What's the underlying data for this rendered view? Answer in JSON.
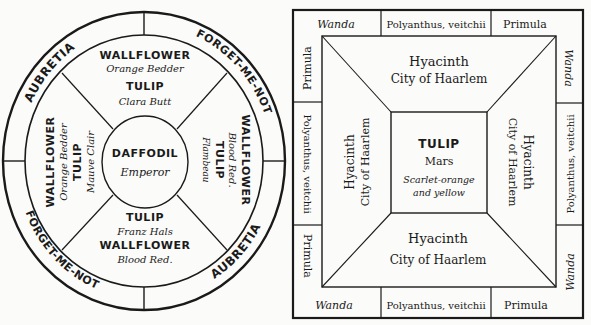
{
  "round_bed": {
    "outer_ring": {
      "top_left": "AUBRETIA",
      "top_right": "FORGET-ME-NOT",
      "bottom_left": "FORGET-ME-NOT",
      "bottom_right": "AUBRETIA"
    },
    "center": {
      "line1": "DAFFODIL",
      "line2": "Emperor"
    },
    "top_segment": {
      "line1": "WALLFLOWER",
      "line2": "Orange Bedder",
      "line3": "TULIP",
      "line4": "Clara Butt"
    },
    "left_segment": {
      "line1": "WALLFLOWER",
      "line2": "Orange Bedder",
      "line3": "TULIP",
      "line4": "Mauve Clair"
    },
    "right_segment": {
      "line1": "WALLFLOWER",
      "line2": "Blood Red.",
      "line3": "TULIP",
      "line4": "Flambeau"
    },
    "bottom_segment": {
      "line1": "TULIP",
      "line2": "Franz Hals",
      "line3": "WALLFLOWER",
      "line4": "Blood Red."
    }
  },
  "square_bed": {
    "border": {
      "top": [
        "Wanda",
        "Polyanthus, veitchii",
        "Primula"
      ],
      "bottom": [
        "Wanda",
        "Polyanthus, veitchii",
        "Primula"
      ],
      "left": [
        "Primula",
        "Polyanthus, veitchii",
        "Primula"
      ],
      "right": [
        "Wanda",
        "Polyanthus, veitchii",
        "Wanda"
      ]
    },
    "top_panel": {
      "line1": "Hyacinth",
      "line2": "City of Haarlem"
    },
    "bottom_panel": {
      "line1": "Hyacinth",
      "line2": "City of Haarlem"
    },
    "left_panel": {
      "line1": "Hyacinth",
      "line2": "City of Haarlem"
    },
    "right_panel": {
      "line1": "Hyacinth",
      "line2": "City of Haarlem"
    },
    "center": {
      "line1": "TULIP",
      "line2": "Mars",
      "line3": "Scarlet-orange",
      "line4": "and yellow"
    }
  }
}
